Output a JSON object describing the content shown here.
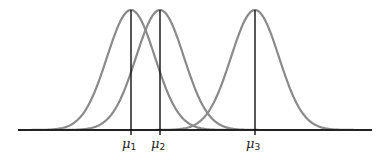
{
  "chart_data": {
    "type": "line",
    "title": "",
    "xlabel": "",
    "ylabel": "",
    "grid": false,
    "series": [
      {
        "name": "curve-1",
        "mean_label": "μ1",
        "mean_px": 131,
        "sigma_px": 24
      },
      {
        "name": "curve-2",
        "mean_label": "μ2",
        "mean_px": 160,
        "sigma_px": 24
      },
      {
        "name": "curve-3",
        "mean_label": "μ3",
        "mean_px": 255,
        "sigma_px": 24
      }
    ],
    "tick_labels": [
      {
        "sym": "μ",
        "sub": "1",
        "x": 131
      },
      {
        "sym": "μ",
        "sub": "2",
        "x": 160
      },
      {
        "sym": "μ",
        "sub": "3",
        "x": 255
      }
    ],
    "axis": {
      "x_start": 18,
      "x_end": 372,
      "baseline_y": 130,
      "peak_y": 10
    },
    "colors": {
      "curve": "#8a8a8a",
      "axis": "#222222",
      "mean_line": "#111111"
    }
  }
}
